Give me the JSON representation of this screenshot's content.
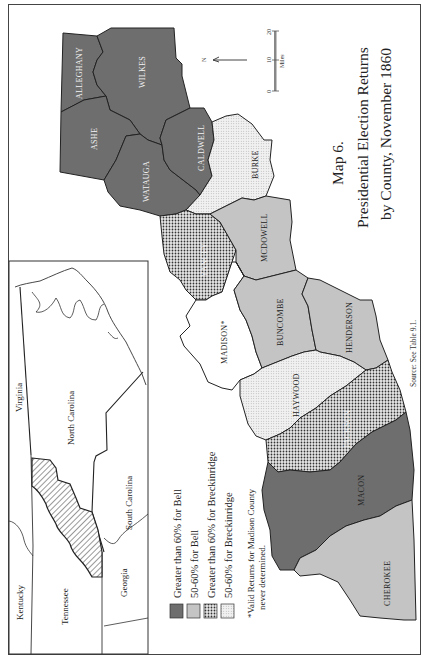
{
  "map": {
    "title_line1": "Map 6.",
    "title_line2": "Presidential Election Returns",
    "title_line3": "by County, November 1860",
    "source": "Source: See Table 9.1.",
    "orientation": "rotated 90° counter-clockwise (text reads bottom-to-top)",
    "north_arrow_label": "N",
    "scale": {
      "ticks": [
        "0",
        "10",
        "20"
      ],
      "unit": "Miles"
    }
  },
  "colors": {
    "bell_over_60": "#6e6e6e",
    "bell_50_60": "#c4c4c4",
    "breck_over_60_pattern": "dense dots on #e0e0e0",
    "breck_50_60_pattern": "fine light dots on #f0f0f0",
    "undetermined": "#ffffff",
    "outline": "#222222"
  },
  "legend": {
    "items": [
      {
        "label": "Greater than 60% for Bell",
        "category": "bell_over_60"
      },
      {
        "label": "50-60% for Bell",
        "category": "bell_50_60"
      },
      {
        "label": "Greater than 60% for Breckinridge",
        "category": "breck_over_60"
      },
      {
        "label": "50-60% for Breckinridge",
        "category": "breck_50_60"
      }
    ],
    "note_line1": "*Valid Returns for Madison County",
    "note_line2": "never determined."
  },
  "counties": [
    {
      "name": "ALLEGHANY",
      "category": "bell_over_60"
    },
    {
      "name": "WILKES",
      "category": "bell_over_60"
    },
    {
      "name": "ASHE",
      "category": "bell_over_60"
    },
    {
      "name": "WATAUGA",
      "category": "bell_over_60"
    },
    {
      "name": "CALDWELL",
      "category": "bell_over_60"
    },
    {
      "name": "BURKE",
      "category": "breck_50_60"
    },
    {
      "name": "YANCEY",
      "category": "breck_over_60"
    },
    {
      "name": "MCDOWELL",
      "category": "bell_50_60"
    },
    {
      "name": "MADISON*",
      "category": "undetermined"
    },
    {
      "name": "BUNCOMBE",
      "category": "bell_50_60"
    },
    {
      "name": "HENDERSON",
      "category": "bell_50_60"
    },
    {
      "name": "HAYWOOD",
      "category": "breck_50_60"
    },
    {
      "name": "JACKSON",
      "category": "breck_over_60"
    },
    {
      "name": "MACON",
      "category": "bell_over_60"
    },
    {
      "name": "CHEROKEE",
      "category": "bell_50_60"
    }
  ],
  "inset": {
    "states": [
      "Virginia",
      "North Carolina",
      "South Carolina",
      "Kentucky",
      "Tennessee",
      "Georgia"
    ],
    "highlight": "hatched western North Carolina study region"
  }
}
